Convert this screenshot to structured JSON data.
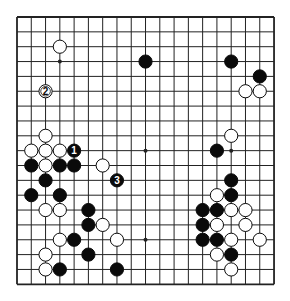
{
  "diagram": {
    "type": "go-board",
    "board_size": 19,
    "geometry": {
      "left": 17,
      "top": 17,
      "dx": 14.28,
      "dy": 14.85,
      "stone_radius": 6.6
    },
    "colors": {
      "line": "#222222",
      "black": "#0a0a0a",
      "white": "#ffffff",
      "background": "#ffffff"
    },
    "star_points": [
      [
        3,
        3
      ],
      [
        9,
        3
      ],
      [
        15,
        3
      ],
      [
        3,
        9
      ],
      [
        9,
        9
      ],
      [
        15,
        9
      ],
      [
        3,
        15
      ],
      [
        9,
        15
      ],
      [
        15,
        15
      ]
    ],
    "stones": [
      {
        "c": "w",
        "x": 3,
        "y": 2
      },
      {
        "c": "b",
        "x": 9,
        "y": 3
      },
      {
        "c": "b",
        "x": 15,
        "y": 3
      },
      {
        "c": "b",
        "x": 17,
        "y": 4
      },
      {
        "c": "w",
        "x": 2,
        "y": 5,
        "label": "2"
      },
      {
        "c": "w",
        "x": 16,
        "y": 5
      },
      {
        "c": "w",
        "x": 17,
        "y": 5
      },
      {
        "c": "w",
        "x": 2,
        "y": 8
      },
      {
        "c": "w",
        "x": 15,
        "y": 8
      },
      {
        "c": "w",
        "x": 1,
        "y": 9
      },
      {
        "c": "w",
        "x": 2,
        "y": 9
      },
      {
        "c": "w",
        "x": 3,
        "y": 9
      },
      {
        "c": "b",
        "x": 4,
        "y": 9,
        "label": "1"
      },
      {
        "c": "b",
        "x": 14,
        "y": 9
      },
      {
        "c": "b",
        "x": 1,
        "y": 10
      },
      {
        "c": "w",
        "x": 2,
        "y": 10
      },
      {
        "c": "b",
        "x": 3,
        "y": 10
      },
      {
        "c": "b",
        "x": 4,
        "y": 10
      },
      {
        "c": "w",
        "x": 6,
        "y": 10
      },
      {
        "c": "b",
        "x": 2,
        "y": 11
      },
      {
        "c": "b",
        "x": 7,
        "y": 11,
        "label": "3"
      },
      {
        "c": "b",
        "x": 15,
        "y": 11
      },
      {
        "c": "b",
        "x": 1,
        "y": 12
      },
      {
        "c": "b",
        "x": 3,
        "y": 12
      },
      {
        "c": "w",
        "x": 14,
        "y": 12
      },
      {
        "c": "b",
        "x": 15,
        "y": 12
      },
      {
        "c": "w",
        "x": 2,
        "y": 13
      },
      {
        "c": "w",
        "x": 3,
        "y": 13
      },
      {
        "c": "b",
        "x": 5,
        "y": 13
      },
      {
        "c": "b",
        "x": 13,
        "y": 13
      },
      {
        "c": "b",
        "x": 14,
        "y": 13
      },
      {
        "c": "w",
        "x": 15,
        "y": 13
      },
      {
        "c": "w",
        "x": 16,
        "y": 13
      },
      {
        "c": "b",
        "x": 5,
        "y": 14
      },
      {
        "c": "w",
        "x": 6,
        "y": 14
      },
      {
        "c": "b",
        "x": 13,
        "y": 14
      },
      {
        "c": "w",
        "x": 14,
        "y": 14
      },
      {
        "c": "w",
        "x": 16,
        "y": 14
      },
      {
        "c": "w",
        "x": 3,
        "y": 15
      },
      {
        "c": "b",
        "x": 4,
        "y": 15
      },
      {
        "c": "w",
        "x": 7,
        "y": 15
      },
      {
        "c": "b",
        "x": 13,
        "y": 15
      },
      {
        "c": "b",
        "x": 14,
        "y": 15
      },
      {
        "c": "w",
        "x": 15,
        "y": 15
      },
      {
        "c": "w",
        "x": 17,
        "y": 15
      },
      {
        "c": "w",
        "x": 2,
        "y": 16
      },
      {
        "c": "b",
        "x": 5,
        "y": 16
      },
      {
        "c": "w",
        "x": 14,
        "y": 16
      },
      {
        "c": "b",
        "x": 15,
        "y": 16
      },
      {
        "c": "w",
        "x": 2,
        "y": 17
      },
      {
        "c": "b",
        "x": 3,
        "y": 17
      },
      {
        "c": "b",
        "x": 7,
        "y": 17
      },
      {
        "c": "w",
        "x": 15,
        "y": 17
      }
    ],
    "move_labels": [
      "1",
      "2",
      "3"
    ]
  }
}
